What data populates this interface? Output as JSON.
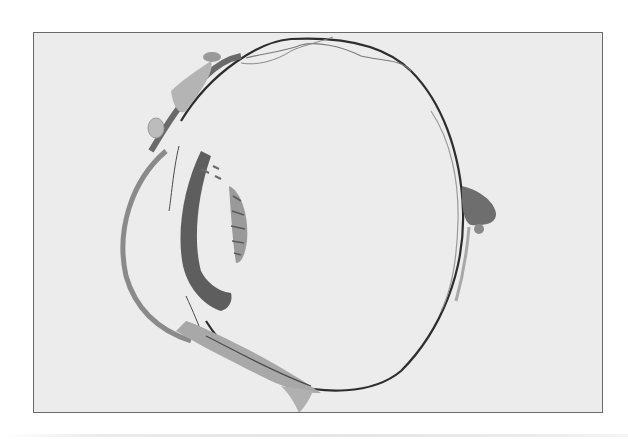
{
  "figure": {
    "frame": {
      "x": 33,
      "y": 32,
      "width": 570,
      "height": 381,
      "border_color": "#6a6a6a",
      "background": "#ececec"
    },
    "colors": {
      "tissue_dark": "#5a5a5a",
      "tissue_mid": "#8a8a8a",
      "tissue_light": "#b4b4b4",
      "line_dark": "#2e2e2e"
    },
    "structures": [
      {
        "name": "cornea",
        "position": "left arc"
      },
      {
        "name": "iris-ciliary",
        "position": "dark crescent left of lens"
      },
      {
        "name": "lens",
        "position": "striated oval center-left"
      },
      {
        "name": "sclera-retina",
        "position": "large outer circle"
      },
      {
        "name": "optic-nerve-head",
        "position": "right bulge"
      },
      {
        "name": "eyelid-conjunctiva-top",
        "position": "upper left"
      },
      {
        "name": "eyelid-conjunctiva-bottom",
        "position": "lower left"
      }
    ]
  }
}
